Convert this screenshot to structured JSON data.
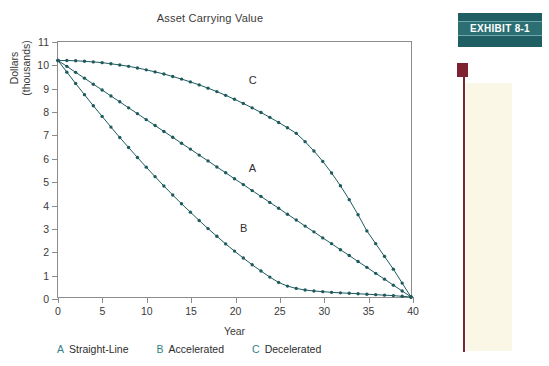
{
  "chart_data": {
    "type": "line",
    "title": "Asset Carrying Value",
    "xlabel": "Year",
    "ylabel": "Dollars\n(thousands)",
    "ylabel_line1": "Dollars",
    "ylabel_line2": "(thousands)",
    "xlim": [
      0,
      40
    ],
    "ylim": [
      0,
      11
    ],
    "xticks": [
      0,
      5,
      10,
      15,
      20,
      25,
      30,
      35,
      40
    ],
    "yticks": [
      0,
      1,
      2,
      3,
      4,
      5,
      6,
      7,
      8,
      9,
      10,
      11
    ],
    "grid": false,
    "legend_position": "below-axis",
    "marker": "circle",
    "series_color": "#1d5a5e",
    "x": [
      0,
      1,
      2,
      3,
      4,
      5,
      6,
      7,
      8,
      9,
      10,
      11,
      12,
      13,
      14,
      15,
      16,
      17,
      18,
      19,
      20,
      21,
      22,
      23,
      24,
      25,
      26,
      27,
      28,
      29,
      30,
      31,
      32,
      33,
      34,
      35,
      36,
      37,
      38,
      39,
      40
    ],
    "series": [
      {
        "name": "A",
        "label": "Straight-Line",
        "curve_label": "A",
        "values": [
          10.2,
          9.95,
          9.69,
          9.44,
          9.18,
          8.93,
          8.67,
          8.42,
          8.16,
          7.91,
          7.65,
          7.4,
          7.14,
          6.89,
          6.63,
          6.38,
          6.12,
          5.87,
          5.61,
          5.36,
          5.1,
          4.85,
          4.59,
          4.34,
          4.08,
          3.83,
          3.57,
          3.32,
          3.06,
          2.81,
          2.55,
          2.3,
          2.04,
          1.79,
          1.53,
          1.28,
          1.02,
          0.77,
          0.51,
          0.26,
          0.0
        ]
      },
      {
        "name": "B",
        "label": "Accelerated",
        "curve_label": "B",
        "values": [
          10.2,
          9.7,
          9.21,
          8.73,
          8.25,
          7.79,
          7.33,
          6.88,
          6.45,
          6.02,
          5.6,
          5.19,
          4.79,
          4.4,
          4.02,
          3.66,
          3.3,
          2.95,
          2.62,
          2.29,
          1.98,
          1.68,
          1.39,
          1.12,
          0.86,
          0.63,
          0.47,
          0.37,
          0.3,
          0.26,
          0.23,
          0.2,
          0.18,
          0.16,
          0.14,
          0.12,
          0.1,
          0.08,
          0.06,
          0.03,
          0.0
        ]
      },
      {
        "name": "C",
        "label": "Decelerated",
        "curve_label": "C",
        "values": [
          10.2,
          10.2,
          10.19,
          10.17,
          10.14,
          10.11,
          10.06,
          10.01,
          9.95,
          9.88,
          9.8,
          9.71,
          9.62,
          9.51,
          9.4,
          9.28,
          9.15,
          9.01,
          8.86,
          8.7,
          8.53,
          8.35,
          8.16,
          7.96,
          7.75,
          7.53,
          7.3,
          7.06,
          6.7,
          6.3,
          5.85,
          5.35,
          4.8,
          4.2,
          3.55,
          2.85,
          2.3,
          1.75,
          1.2,
          0.6,
          0.0
        ]
      }
    ],
    "curve_annotations": [
      {
        "text": "C",
        "x": 21.5,
        "y": 9.35
      },
      {
        "text": "A",
        "x": 21.5,
        "y": 5.55
      },
      {
        "text": "B",
        "x": 20.5,
        "y": 3.0
      }
    ]
  },
  "legend": {
    "items": [
      {
        "key": "A",
        "label": "Straight-Line"
      },
      {
        "key": "B",
        "label": "Accelerated"
      },
      {
        "key": "C",
        "label": "Decelerated"
      }
    ]
  },
  "exhibit": {
    "label": "EXHIBIT  8-1"
  },
  "colors": {
    "curve": "#1d5a5e",
    "exhibit_box": "#1f5e63",
    "exhibit_band": "#2c6f73",
    "marker_maroon": "#7e2231",
    "cream": "#fbf7e6",
    "axis": "#8c8c8c",
    "text": "#3a3a3a",
    "legend_key": "#2f7f86"
  }
}
